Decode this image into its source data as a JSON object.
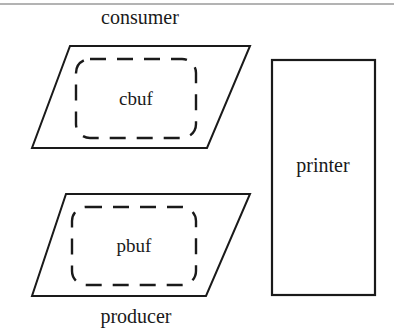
{
  "diagram": {
    "top_rule": {
      "name": "page-divider",
      "y": 4,
      "x1": 0,
      "x2": 394,
      "color": "#9a9a9a"
    },
    "colors": {
      "stroke": "#1a1a1a",
      "fill": "#ffffff",
      "text": "#1a1a1a",
      "rule": "#9a9a9a"
    },
    "nodes": [
      {
        "id": "consumer",
        "shape": "parallelogram",
        "label": "consumer",
        "label_position": "above",
        "label_x": 140,
        "label_y": 24,
        "points": "70,46 250,46 207,148 32,148"
      },
      {
        "id": "cbuf",
        "shape": "dashed-rounded-rect",
        "label": "cbuf",
        "label_position": "center",
        "label_x": 136,
        "label_y": 105,
        "x": 76,
        "y": 59,
        "width": 120,
        "height": 79,
        "rx": 14
      },
      {
        "id": "producer",
        "shape": "parallelogram",
        "label": "producer",
        "label_position": "below",
        "label_x": 136,
        "label_y": 323,
        "points": "66,194 250,194 206,296 32,296"
      },
      {
        "id": "pbuf",
        "shape": "dashed-rounded-rect",
        "label": "pbuf",
        "label_position": "center",
        "label_x": 134,
        "label_y": 252,
        "x": 72,
        "y": 207,
        "width": 124,
        "height": 78,
        "rx": 14
      },
      {
        "id": "printer",
        "shape": "rect",
        "label": "printer",
        "label_position": "center",
        "label_x": 323,
        "label_y": 172,
        "x": 272,
        "y": 60,
        "width": 103,
        "height": 235
      }
    ],
    "labels": {
      "consumer": "consumer",
      "cbuf": "cbuf",
      "producer": "producer",
      "pbuf": "pbuf",
      "printer": "printer"
    }
  }
}
